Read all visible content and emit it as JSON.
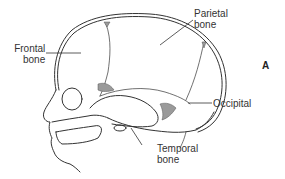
{
  "figure": {
    "panel_letter": "A",
    "labels": {
      "frontal": [
        "Frontal",
        "bone"
      ],
      "parietal": [
        "Parietal",
        "bone"
      ],
      "occipital": [
        "Occipital"
      ],
      "temporal": [
        "Temporal",
        "bone"
      ]
    },
    "colors": {
      "line": "#333333",
      "fontanelle": "#9a9a9a"
    }
  }
}
